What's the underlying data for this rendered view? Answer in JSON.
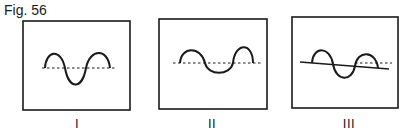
{
  "figure": {
    "title": "Fig. 56",
    "stroke_color": "#1a1a1a",
    "panels": [
      {
        "label": "I",
        "box": {
          "x": 23,
          "y": 21,
          "w": 107,
          "h": 89
        },
        "baseline": {
          "style": "dashed",
          "x1": 42,
          "y1": 68,
          "x2": 116,
          "y2": 68
        },
        "wave": "M45,68 C46,50 61,48 65,68 C69,90 82,90 86,68 C90,48 108,48 110,68",
        "description": "Symmetric sine wave: crest, trough, crest, centered on a dashed baseline"
      },
      {
        "label": "II",
        "box": {
          "x": 159,
          "y": 19,
          "w": 108,
          "h": 90
        },
        "baseline": {
          "style": "dashed",
          "x1": 173,
          "y1": 63,
          "x2": 261,
          "y2": 63
        },
        "wave": "M180,63 C181,46 201,46 205,63 C208,76 230,76 233,63 C235,42 253,42 253,63",
        "description": "Wave with crests above a dashed baseline and a flattened trough"
      },
      {
        "label": "III",
        "box": {
          "x": 292,
          "y": 17,
          "w": 106,
          "h": 91
        },
        "baseline": {
          "style": "solid",
          "x1": 300,
          "y1": 62,
          "x2": 389,
          "y2": 69
        },
        "reference_line": {
          "style": "dashed",
          "x1": 355,
          "y1": 63,
          "x2": 392,
          "y2": 63
        },
        "wave": "M312,63 C313,46 330,46 333,64 C336,82 352,82 355,66 C357,50 376,50 378,68",
        "description": "Wave on a sloping solid baseline with a short dashed horizontal reference line"
      }
    ]
  }
}
